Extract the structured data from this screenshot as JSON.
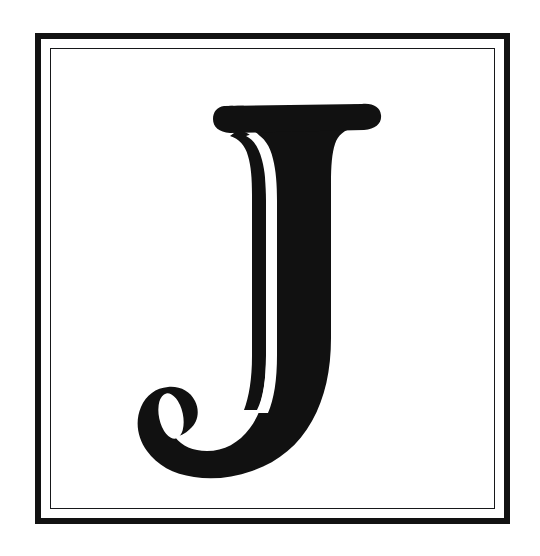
{
  "page": {
    "background_color": "#ffffff",
    "width": 540,
    "height": 556
  },
  "plate": {
    "name": "decorative-initial-plate",
    "outer_border_color": "#121212",
    "inner_border_color": "#17181a",
    "field_color": "#ffffff",
    "outer_border_width_px": 6.5,
    "inner_border_width_px": 1.8,
    "border_gap_px": 8
  },
  "initial": {
    "character": "J",
    "alt_text": "J",
    "style": "serif display capital with inline white stroke",
    "ink_color": "#111111",
    "counter_color": "#ffffff",
    "features": [
      "top slab serif with rounded terminals",
      "thin inline stroke separated from thick stem by white sliver",
      "descending bowl curving left",
      "hook terminal with white oval counter"
    ]
  },
  "caption": {
    "text": ""
  }
}
